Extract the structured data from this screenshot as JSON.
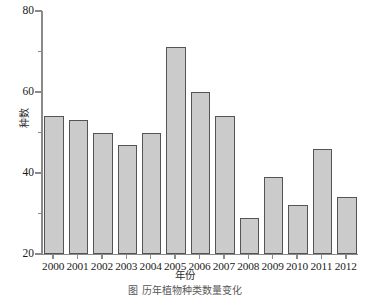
{
  "chart_data": {
    "type": "bar",
    "title": "",
    "xlabel": "年份",
    "ylabel": "种数",
    "categories": [
      "2000",
      "2001",
      "2002",
      "2003",
      "2004",
      "2005",
      "2006",
      "2007",
      "2008",
      "2009",
      "2010",
      "2011",
      "2012"
    ],
    "values": [
      54,
      53,
      50,
      47,
      50,
      71,
      60,
      54,
      29,
      39,
      32,
      46,
      34
    ],
    "ylim": [
      20,
      80
    ],
    "ytick_labels": [
      "20",
      "40",
      "60",
      "80"
    ],
    "ytick_values": [
      20,
      40,
      60,
      80
    ],
    "yminor_tick_values": [
      30,
      50,
      70
    ],
    "grid": false,
    "legend": false,
    "legend_position": "none",
    "bar_fill_color": "#cbcbcb",
    "bar_edge_color": "#545454",
    "axis_color": "#8a8a8a"
  },
  "figure": {
    "caption": "图  历年植物种类数量变化"
  }
}
